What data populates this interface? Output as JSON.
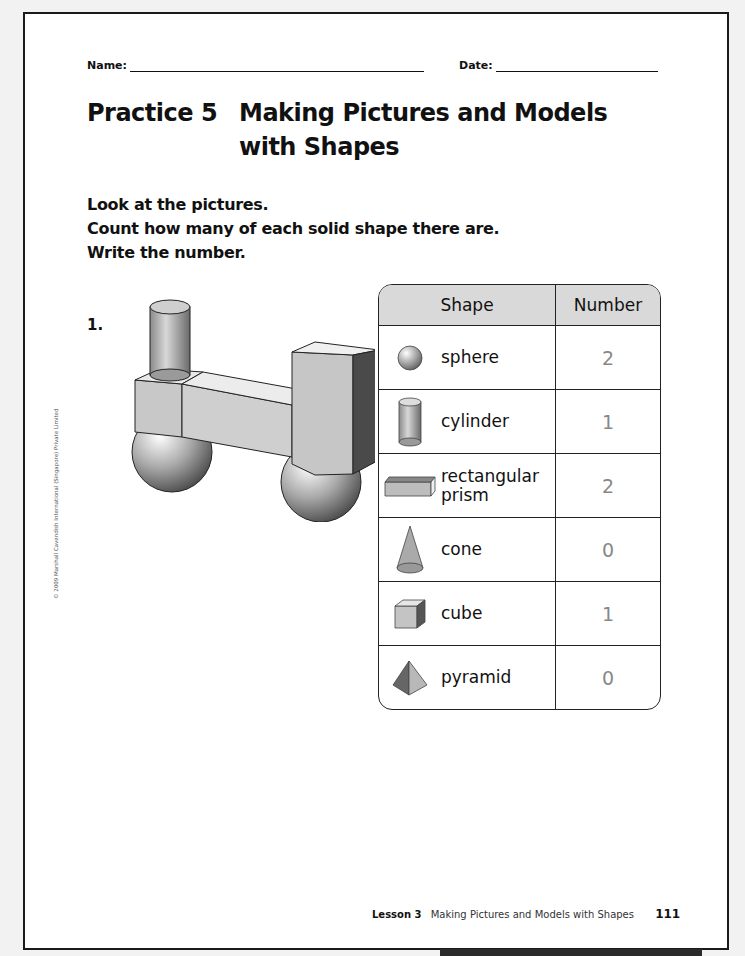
{
  "header": {
    "name_label": "Name:",
    "date_label": "Date:"
  },
  "title": {
    "practice": "Practice 5",
    "line1": "Making Pictures and Models",
    "line2": "with Shapes"
  },
  "instructions": [
    "Look at the pictures.",
    "Count how many of each solid shape there are.",
    "Write the number."
  ],
  "question": {
    "number": "1.",
    "picture": "model built from 1 cylinder, 1 cube, 2 rectangular prisms and 2 spheres"
  },
  "table": {
    "headers": [
      "Shape",
      "Number"
    ],
    "rows": [
      {
        "icon": "sphere-icon",
        "label": "sphere",
        "number": "2"
      },
      {
        "icon": "cylinder-icon",
        "label": "cylinder",
        "number": "1"
      },
      {
        "icon": "rectangular-prism-icon",
        "label": "rectangular prism",
        "number": "2"
      },
      {
        "icon": "cone-icon",
        "label": "cone",
        "number": "0"
      },
      {
        "icon": "cube-icon",
        "label": "cube",
        "number": "1"
      },
      {
        "icon": "pyramid-icon",
        "label": "pyramid",
        "number": "0"
      }
    ]
  },
  "copyright": "© 2009 Marshall Cavendish International (Singapore) Private Limited",
  "footer": {
    "lesson": "Lesson 3",
    "lesson_title": "Making Pictures and Models with Shapes",
    "page_number": "111"
  }
}
